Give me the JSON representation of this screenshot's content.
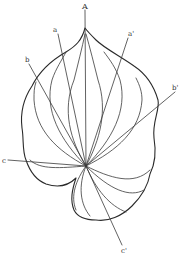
{
  "figure": {
    "labels": {
      "apex": "A",
      "a": "a",
      "a_prime": "a'",
      "b": "b",
      "b_prime": "b'",
      "c": "c",
      "c_prime": "c'"
    },
    "colors": {
      "line": "#2a2a2a",
      "background": "#ffffff"
    }
  }
}
